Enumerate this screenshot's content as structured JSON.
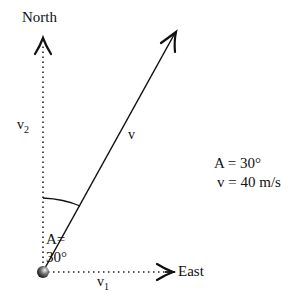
{
  "diagram": {
    "labels": {
      "north": "North",
      "east": "East",
      "v2": "v",
      "v2_sub": "2",
      "v1": "v",
      "v1_sub": "1",
      "v": "v",
      "angle_line1": "A=",
      "angle_line2": "30°"
    },
    "info": {
      "line1": "A = 30°",
      "line2": "v = 40 m/s"
    },
    "vectors": {
      "origin": [
        43,
        272
      ],
      "north_tip": [
        43,
        40
      ],
      "east_tip": [
        172,
        272
      ],
      "v_tip": [
        175,
        32
      ],
      "angle_deg": 30,
      "speed_mps": 40
    },
    "colors": {
      "line": "#111111",
      "background": "#ffffff"
    }
  }
}
